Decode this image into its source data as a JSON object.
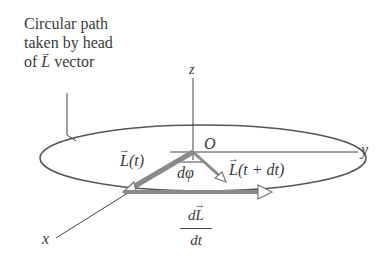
{
  "caption": {
    "line1": "Circular path",
    "line2": "taken by head",
    "line3_prefix": "of ",
    "line3_vector": "L",
    "line3_suffix": " vector"
  },
  "axes": {
    "z": "z",
    "y": "y",
    "x": "x",
    "origin": "O"
  },
  "vectors": {
    "L_t_symbol": "L",
    "L_t_arg": "(t)",
    "L_tdt_symbol": "L",
    "L_tdt_arg": "(t + dt)",
    "dL_num_prefix": "d",
    "dL_num_vector": "L",
    "dL_den": "dt"
  },
  "angle": {
    "label": "dφ"
  },
  "colors": {
    "ink": "#3a3a3a",
    "vector_fill": "#8a8a8a",
    "ellipse": "#555555"
  }
}
